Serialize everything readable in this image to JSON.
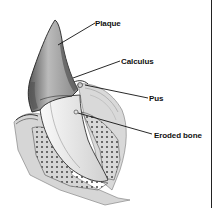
{
  "diagram": {
    "labels": [
      {
        "id": "plaque",
        "text": "Plaque",
        "x": 95,
        "y": 19
      },
      {
        "id": "calculus",
        "text": "Calculus",
        "x": 121,
        "y": 57
      },
      {
        "id": "pus",
        "text": "Pus",
        "x": 149,
        "y": 94
      },
      {
        "id": "eroded-bone",
        "text": "Eroded bone",
        "x": 154,
        "y": 131
      }
    ],
    "colors": {
      "line": "#222222",
      "crown": "#9a9a9a",
      "root": "#e8e8e8",
      "gum": "#cfcfcf",
      "bone_dots": "#444444"
    }
  }
}
